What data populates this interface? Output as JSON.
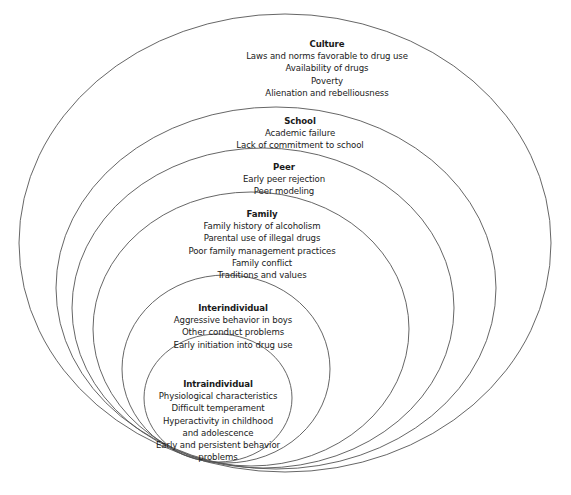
{
  "diagram": {
    "type": "nested-ellipses",
    "stroke_color": "#555555",
    "background": "#ffffff",
    "levels": [
      {
        "title": "Culture",
        "items": [
          "Laws and norms favorable to drug use",
          "Availability of drugs",
          "Poverty",
          "Alienation and rebelliousness"
        ]
      },
      {
        "title": "School",
        "items": [
          "Academic failure",
          "Lack of commitment to school"
        ]
      },
      {
        "title": "Peer",
        "items": [
          "Early peer rejection",
          "Peer modeling"
        ]
      },
      {
        "title": "Family",
        "items": [
          "Family history of alcoholism",
          "Parental use of illegal drugs",
          "Poor family management practices",
          "Family conflict",
          "Traditions and values"
        ]
      },
      {
        "title": "Interindividual",
        "items": [
          "Aggressive behavior in boys",
          "Other conduct problems",
          "Early initiation into drug use"
        ]
      },
      {
        "title": "Intraindividual",
        "items": [
          "Physiological characteristics",
          "Difficult temperament",
          "Hyperactivity in childhood",
          "and adolescence",
          "Early and persistent behavior",
          "problems"
        ]
      }
    ]
  }
}
